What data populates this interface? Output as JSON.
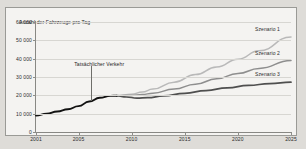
{
  "figure": {
    "background_color": "#f4f3f1",
    "border_color": "#9a9a96",
    "page_background": "#dedcd8"
  },
  "annotations": {
    "actual_traffic_label": "Tatsächlicher Verkehr",
    "series_labels": [
      "Szenario 1",
      "Szenario 2",
      "Szenario 3"
    ]
  },
  "chart_data": {
    "type": "line",
    "title": "",
    "xlabel": "",
    "ylabel": "Anzahl der Fahrzeuge pro Tag",
    "ylabel_position": "top-left-inline",
    "xlim": [
      2001,
      2025
    ],
    "ylim": [
      0,
      60000
    ],
    "yticks": [
      0,
      10000,
      20000,
      30000,
      40000,
      50000,
      60000
    ],
    "ytick_labels": [
      "0",
      "10 000",
      "20 000",
      "30 000",
      "40 000",
      "50 000",
      "60 000"
    ],
    "xticks": [
      2001,
      2005,
      2010,
      2015,
      2020,
      2025
    ],
    "xtick_labels": [
      "2001",
      "2005",
      "2010",
      "2015",
      "2020",
      "2025"
    ],
    "grid": true,
    "grid_axis": "y",
    "grid_color": "#d7d6d2",
    "legend": "inline-right-of-line-ends",
    "series": [
      {
        "name": "Tatsächlicher Verkehr",
        "color": "#121212",
        "width": 1.9,
        "x": [
          2001,
          2002,
          2003,
          2004,
          2005,
          2006,
          2007,
          2008,
          2008.6
        ],
        "values": [
          9000,
          10000,
          11200,
          12400,
          14100,
          16600,
          18700,
          19700,
          19800
        ]
      },
      {
        "name": "Szenario 1",
        "color": "#b9b9b9",
        "width": 1.5,
        "x": [
          2008.6,
          2010,
          2011,
          2012,
          2014,
          2016,
          2018,
          2020,
          2022,
          2025
        ],
        "values": [
          19800,
          20600,
          21800,
          23400,
          27200,
          31300,
          35400,
          39700,
          44300,
          51800
        ]
      },
      {
        "name": "Szenario 2",
        "color": "#8e8e8e",
        "width": 1.5,
        "x": [
          2008.6,
          2010,
          2011,
          2012,
          2014,
          2016,
          2018,
          2020,
          2022,
          2025
        ],
        "values": [
          19800,
          19900,
          20400,
          21200,
          23400,
          26100,
          29000,
          31900,
          34700,
          39000
        ]
      },
      {
        "name": "Szenario 3",
        "color": "#4f4f4f",
        "width": 1.7,
        "x": [
          2008.6,
          2009.5,
          2010.5,
          2011.5,
          2013,
          2015,
          2017,
          2019,
          2021,
          2023,
          2025
        ],
        "values": [
          19800,
          19100,
          18500,
          18700,
          19700,
          21100,
          22600,
          24100,
          25400,
          26400,
          27200
        ]
      }
    ]
  }
}
